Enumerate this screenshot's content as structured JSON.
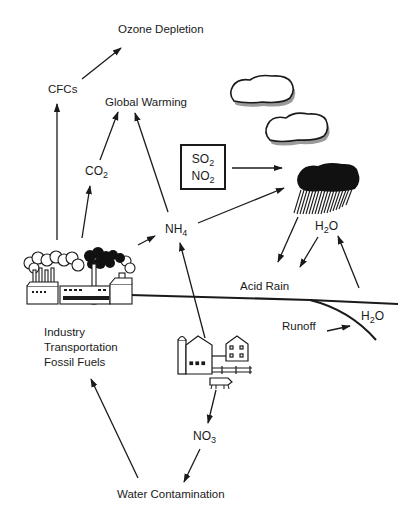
{
  "diagram": {
    "title": "Ozone Depletion",
    "nodes": {
      "ozone_depletion": {
        "label": "Ozone Depletion"
      },
      "cfcs": {
        "label": "CFCs"
      },
      "global_warming": {
        "label": "Global Warming"
      },
      "co2": {
        "base": "CO",
        "sub": "2"
      },
      "nh4": {
        "base": "NH",
        "sub": "4"
      },
      "so2": {
        "base": "SO",
        "sub": "2"
      },
      "no2": {
        "base": "NO",
        "sub": "2"
      },
      "h2o_rain": {
        "pre": "H",
        "sub": "2",
        "post": "O"
      },
      "acid_rain": {
        "label": "Acid Rain"
      },
      "h2o_runoff": {
        "pre": "H",
        "sub": "2",
        "post": "O"
      },
      "runoff": {
        "label": "Runoff"
      },
      "sources": {
        "lines": [
          "Industry",
          "Transportation",
          "Fossil Fuels"
        ]
      },
      "no3": {
        "base": "NO",
        "sub": "3"
      },
      "water_contamination": {
        "label": "Water Contamination"
      }
    },
    "illustrations": [
      "factory-icon",
      "farm-icon",
      "cloud-icon",
      "cloud-icon",
      "rain-cloud-icon"
    ],
    "edges": [
      {
        "from": "CFCs",
        "to": "Ozone Depletion"
      },
      {
        "from": "Industry",
        "to": "CFCs"
      },
      {
        "from": "Industry",
        "to": "CO2"
      },
      {
        "from": "Industry",
        "to": "NH4"
      },
      {
        "from": "CO2",
        "to": "Global Warming"
      },
      {
        "from": "NH4",
        "to": "Global Warming"
      },
      {
        "from": "NH4",
        "to": "Rain Cloud"
      },
      {
        "from": "SO2/NO2",
        "to": "Rain Cloud"
      },
      {
        "from": "Rain Cloud",
        "to": "Acid Rain"
      },
      {
        "from": "H2O",
        "to": "Acid Rain"
      },
      {
        "from": "Ground",
        "to": "H2O"
      },
      {
        "from": "Runoff",
        "to": "H2O"
      },
      {
        "from": "Farm",
        "to": "NH4"
      },
      {
        "from": "Farm",
        "to": "NO3"
      },
      {
        "from": "NO3",
        "to": "Water Contamination"
      },
      {
        "from": "Water Contamination",
        "to": "Industry"
      }
    ],
    "colors": {
      "ink": "#1a1a1a",
      "background": "#ffffff",
      "cloud_shadow": "#9a9a9a"
    }
  }
}
